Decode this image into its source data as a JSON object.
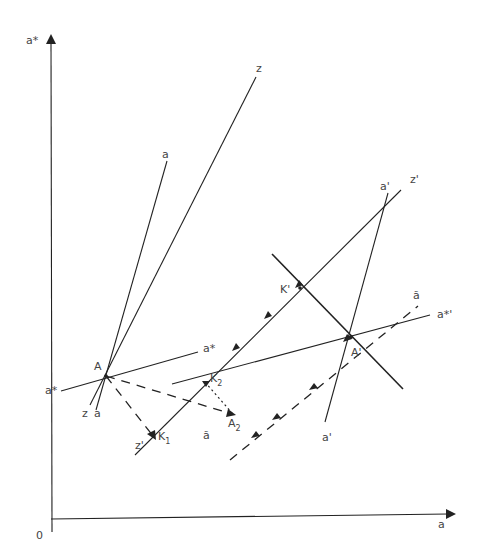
{
  "diagram": {
    "axes": {
      "y_label": "a*",
      "x_label": "a",
      "origin_label": "0"
    },
    "points": {
      "A": "A",
      "A_prime": "A'",
      "K1": "K",
      "K1_sub": "1",
      "K2": "K",
      "K2_sub": "2",
      "K_prime": "K'",
      "A2": "A",
      "A2_sub": "2"
    },
    "lines": {
      "a_top": "a",
      "z_top": "z",
      "a_star_right": "a*",
      "a_star_left": "a*",
      "z_bottom": "z",
      "a_bottom": "a",
      "z_prime_bottom": "z'",
      "z_prime_top": "z'",
      "a_prime_top": "a'",
      "a_prime_bottom": "a'",
      "a_star_prime": "a*'",
      "a_tilde_top": "ã",
      "a_tilde_bottom": "ã"
    },
    "colors": {
      "line": "#222222",
      "text": "#444444",
      "background": "#ffffff"
    }
  }
}
